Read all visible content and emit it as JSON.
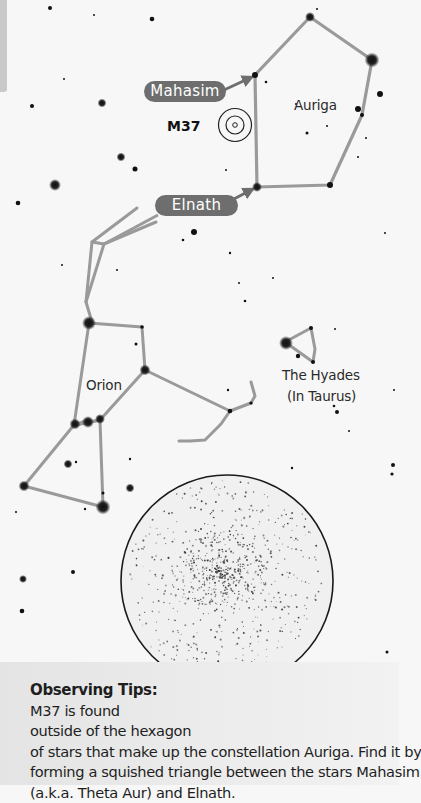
{
  "labels": {
    "mahasim": "Mahasim",
    "elnath": "Elnath",
    "m37": "M37",
    "auriga": "Auriga",
    "orion": "Orion",
    "hyades_line1": "The Hyades",
    "hyades_line2": "(In Taurus)"
  },
  "tips": {
    "title": "Observing Tips:",
    "lines": [
      "M37 is found",
      "outside of the hexagon",
      "of stars that make up the constellation Auriga. Find it by",
      "forming a squished triangle between the stars Mahasim",
      "(a.k.a. Theta Aur) and Elnath."
    ]
  },
  "colors": {
    "background": "#f7f7f7",
    "constellation_line": "#9a9a9a",
    "label_pill": "#6e6e6e",
    "eyepiece_border": "#1a1a1a",
    "tips_band": "#e8e8e8"
  },
  "constellations": {
    "auriga": [
      [
        255,
        75
      ],
      [
        310,
        17
      ],
      [
        372,
        60
      ],
      [
        362,
        115
      ],
      [
        330,
        185
      ],
      [
        257,
        187
      ],
      [
        255,
        75
      ]
    ],
    "orion": [
      [
        [
          137,
          70
        ],
        [
          90,
          100
        ],
        [
          104,
          103
        ],
        [
          86,
          162
        ],
        [
          93,
          213
        ],
        [
          149,
          220
        ],
        [
          156,
          287
        ],
        [
          118,
          370
        ],
        [
          103,
          395
        ]
      ],
      [
        [
          93,
          213
        ],
        [
          75,
          424
        ],
        [
          20,
          488
        ],
        [
          102,
          508
        ],
        [
          100,
          420
        ],
        [
          150,
          290
        ],
        [
          246,
          339
        ],
        [
          235,
          405
        ],
        [
          180,
          440
        ]
      ],
      [
        [
          86,
          162
        ],
        [
          104,
          103
        ]
      ],
      [
        [
          75,
          424
        ],
        [
          100,
          420
        ]
      ],
      [
        [
          246,
          339
        ],
        [
          252,
          318
        ]
      ]
    ],
    "hyades": [
      [
        286,
        343
      ],
      [
        311,
        328
      ],
      [
        313,
        363
      ],
      [
        298,
        358
      ],
      [
        286,
        343
      ]
    ]
  }
}
